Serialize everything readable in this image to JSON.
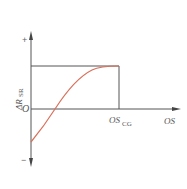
{
  "diagram": {
    "y_axis_label": "ΔR",
    "y_axis_subscript": "SR",
    "plus_sign": "+",
    "minus_sign": "−",
    "origin_label": "O",
    "x_axis_label": "OS",
    "critical_label": "OS",
    "critical_subscript": "CG",
    "curve_color": "#d9705a",
    "axis_color": "#555555"
  }
}
